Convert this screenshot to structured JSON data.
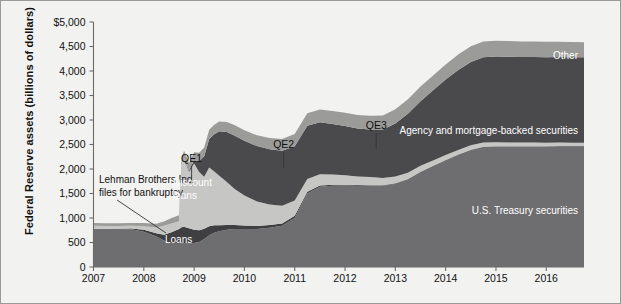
{
  "figure": {
    "background": "#f2f2f0",
    "frame_color": "#9a9a9a"
  },
  "axes": {
    "ylabel": "Federal Reserve assets (billions of dollars)",
    "yticks": [
      "$5,000",
      "4,500",
      "4,000",
      "3,500",
      "3,000",
      "2,500",
      "2,000",
      "1,500",
      "1,000",
      "500",
      "0"
    ],
    "ytick_values": [
      5000,
      4500,
      4000,
      3500,
      3000,
      2500,
      2000,
      1500,
      1000,
      500,
      0
    ],
    "xticks": [
      "2007",
      "2008",
      "2009",
      "2010",
      "2011",
      "2012",
      "2013",
      "2014",
      "2015",
      "2016"
    ],
    "xtick_values": [
      2007,
      2008,
      2009,
      2010,
      2011,
      2012,
      2013,
      2014,
      2015,
      2016
    ],
    "ylim": [
      0,
      5000
    ],
    "xlim": [
      2007,
      2016.75
    ],
    "grid": false
  },
  "annotations": [
    {
      "name": "lehman",
      "line1": "Lehman Brothers Inc.",
      "line2": "files for bankruptcy.",
      "x": 2008.62,
      "y": 880
    },
    {
      "name": "qe1",
      "label": "QE1",
      "x": 2008.95,
      "y": 2150
    },
    {
      "name": "qe2",
      "label": "QE2",
      "x": 2010.78,
      "y": 2430
    },
    {
      "name": "qe3",
      "label": "QE3",
      "x": 2012.62,
      "y": 2820
    }
  ],
  "series_labels": [
    {
      "name": "other",
      "text": "Other",
      "color": "#ffffff"
    },
    {
      "name": "agency",
      "text": "Agency and mortgage-backed securities",
      "color": "#ffffff"
    },
    {
      "name": "treasury",
      "text": "U.S. Treasury securities",
      "color": "#ffffff"
    },
    {
      "name": "discount-loans",
      "text": "Discount loans",
      "line1": "Discount",
      "line2": "loans",
      "color": "#ffffff"
    },
    {
      "name": "loans",
      "text": "Loans",
      "color": "#ffffff"
    }
  ],
  "chart_data": {
    "type": "area",
    "title": "",
    "xlabel": "",
    "ylabel": "Federal Reserve assets (billions of dollars)",
    "ylim": [
      0,
      5000
    ],
    "xlim": [
      2007,
      2016.75
    ],
    "grid": false,
    "legend": "in-plot labels",
    "stacking": "stacked (bottom to top): U.S. Treasury securities, Loans, Discount loans, Agency and mortgage-backed securities, Other",
    "colors": {
      "U.S. Treasury securities": "#6e6e70",
      "Loans": "#3f3f42",
      "Discount loans": "#c6c6c4",
      "Agency and mortgage-backed securities": "#4a4a4d",
      "Other": "#9b9b99"
    },
    "x": [
      2007.0,
      2007.25,
      2007.5,
      2007.75,
      2008.0,
      2008.25,
      2008.4,
      2008.55,
      2008.7,
      2008.75,
      2008.8,
      2008.9,
      2009.0,
      2009.1,
      2009.2,
      2009.3,
      2009.4,
      2009.5,
      2009.65,
      2009.8,
      2010.0,
      2010.25,
      2010.5,
      2010.75,
      2011.0,
      2011.25,
      2011.5,
      2011.75,
      2012.0,
      2012.25,
      2012.5,
      2012.75,
      2013.0,
      2013.25,
      2013.5,
      2013.75,
      2014.0,
      2014.25,
      2014.5,
      2014.75,
      2015.0,
      2015.25,
      2015.5,
      2015.75,
      2016.0,
      2016.25,
      2016.5,
      2016.75
    ],
    "series": [
      {
        "name": "U.S. Treasury securities",
        "values": [
          780,
          780,
          775,
          770,
          720,
          620,
          540,
          480,
          475,
          480,
          480,
          480,
          490,
          510,
          570,
          650,
          700,
          730,
          760,
          776,
          777,
          777,
          800,
          840,
          1000,
          1500,
          1640,
          1660,
          1665,
          1660,
          1660,
          1660,
          1700,
          1790,
          1940,
          2060,
          2180,
          2290,
          2390,
          2450,
          2460,
          2460,
          2460,
          2460,
          2460,
          2465,
          2465,
          2465
        ]
      },
      {
        "name": "Loans",
        "values": [
          0,
          0,
          5,
          15,
          40,
          70,
          120,
          230,
          300,
          330,
          340,
          310,
          270,
          240,
          210,
          180,
          150,
          120,
          95,
          80,
          70,
          60,
          55,
          50,
          45,
          35,
          25,
          20,
          15,
          12,
          10,
          8,
          7,
          6,
          5,
          5,
          5,
          5,
          5,
          5,
          5,
          5,
          5,
          5,
          5,
          5,
          5,
          5
        ]
      },
      {
        "name": "Discount loans",
        "values": [
          60,
          55,
          55,
          55,
          70,
          115,
          180,
          180,
          160,
          1270,
          1400,
          1150,
          1350,
          1190,
          1060,
          1200,
          1100,
          1010,
          880,
          740,
          610,
          500,
          420,
          360,
          310,
          260,
          230,
          210,
          190,
          175,
          165,
          150,
          140,
          130,
          120,
          110,
          100,
          95,
          90,
          85,
          80,
          78,
          76,
          74,
          72,
          70,
          68,
          66
        ]
      },
      {
        "name": "Agency and mortgage-backed securities",
        "values": [
          0,
          0,
          0,
          0,
          0,
          0,
          0,
          0,
          0,
          0,
          10,
          30,
          70,
          220,
          420,
          580,
          760,
          910,
          1020,
          1090,
          1120,
          1130,
          1130,
          1120,
          1110,
          1090,
          1060,
          1030,
          1010,
          980,
          970,
          990,
          1080,
          1200,
          1320,
          1430,
          1540,
          1630,
          1700,
          1740,
          1750,
          1750,
          1745,
          1745,
          1745,
          1745,
          1745,
          1745
        ]
      },
      {
        "name": "Other",
        "values": [
          60,
          60,
          60,
          60,
          70,
          80,
          90,
          110,
          120,
          130,
          140,
          150,
          160,
          170,
          180,
          190,
          195,
          200,
          205,
          210,
          215,
          220,
          230,
          240,
          250,
          255,
          260,
          265,
          270,
          275,
          280,
          285,
          290,
          295,
          300,
          305,
          310,
          315,
          318,
          320,
          320,
          320,
          318,
          316,
          314,
          312,
          310,
          308
        ]
      }
    ],
    "totals_approx": {
      "2007": 900,
      "2008.7": 900,
      "2009.0": 2340,
      "2010.0": 2790,
      "2011.0": 2715,
      "2012.0": 3150,
      "2013.0": 3217,
      "2014.0": 4135,
      "2015.0": 4615,
      "2016.5": 4588
    }
  }
}
